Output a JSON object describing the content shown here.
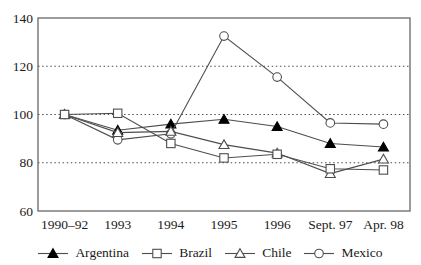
{
  "chart_data": {
    "type": "line",
    "title": "",
    "xlabel": "",
    "ylabel": "",
    "categories": [
      "1990–92",
      "1993",
      "1994",
      "1995",
      "1996",
      "Sept. 97",
      "Apr. 98"
    ],
    "y_ticks": [
      "60",
      "80",
      "100",
      "120",
      "140"
    ],
    "y_tick_values": [
      60,
      80,
      100,
      120,
      140
    ],
    "ylim": [
      60,
      140
    ],
    "gridlines": [
      80,
      100,
      120
    ],
    "grid_style": "dotted",
    "legend_position": "bottom",
    "series": [
      {
        "name": "Argentina",
        "marker": "triangle-filled",
        "values": [
          100,
          93.5,
          96,
          98,
          95,
          88,
          86.5
        ]
      },
      {
        "name": "Brazil",
        "marker": "square-open",
        "values": [
          100,
          100.5,
          88,
          82,
          83.5,
          77.5,
          77
        ]
      },
      {
        "name": "Chile",
        "marker": "triangle-open",
        "values": [
          100,
          92.5,
          93,
          87.5,
          84,
          75.5,
          81.5
        ]
      },
      {
        "name": "Mexico",
        "marker": "circle-open",
        "values": [
          100,
          89.5,
          92,
          132.5,
          115.5,
          96.5,
          96
        ]
      }
    ],
    "draw_order": [
      0,
      3,
      2,
      1
    ],
    "colors": {
      "line": "#4d4d4d",
      "marker_open_fill": "#ffffff",
      "marker_filled": "#000000",
      "grid": "#4d4d4d",
      "axis": "#5a5a5a",
      "text": "#1a1a1a",
      "background": "#ffffff"
    }
  }
}
